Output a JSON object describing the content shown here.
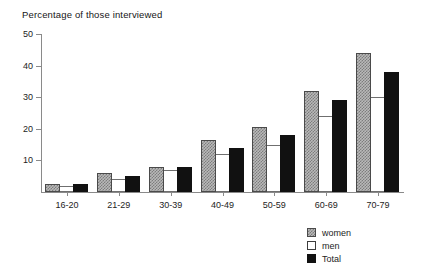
{
  "chart_data": {
    "type": "bar",
    "title": "Percentage of those interviewed",
    "xlabel": "",
    "ylabel": "",
    "ylim": [
      0,
      50
    ],
    "ytick_values": [
      10,
      20,
      30,
      40,
      50
    ],
    "ytick_labels": [
      "10",
      "20",
      "30",
      "40",
      "50"
    ],
    "grid": false,
    "legend_position": "bottom-right",
    "categories": [
      "16-20",
      "21-29",
      "30-39",
      "40-49",
      "50-59",
      "60-69",
      "70-79"
    ],
    "series": [
      {
        "name": "women",
        "style": "checkered-gray",
        "values": [
          2.5,
          6,
          8,
          16.5,
          20.5,
          32,
          44
        ]
      },
      {
        "name": "men",
        "style": "white-outline",
        "values": [
          2,
          4,
          7,
          12,
          15,
          24,
          30
        ]
      },
      {
        "name": "Total",
        "style": "solid-black",
        "values": [
          2.5,
          5,
          8,
          14,
          18,
          29,
          38
        ]
      }
    ]
  },
  "legend": {
    "items": [
      {
        "label": "women"
      },
      {
        "label": "men"
      },
      {
        "label": "Total"
      }
    ]
  },
  "colors": {
    "axis": "#8a8a8a",
    "text": "#1d1d1d",
    "women": "#b9b9b9",
    "men": "#ffffff",
    "total": "#111111"
  }
}
